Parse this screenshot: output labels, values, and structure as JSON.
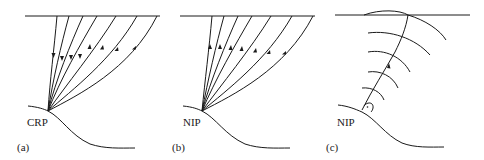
{
  "figure": {
    "panels": [
      {
        "id": "a",
        "caption": "(a)",
        "point_label": "CRP",
        "description": "Common reflection point: rays from reflector point to surface, 4 downgoing and 3 upgoing",
        "ray_count": 7,
        "arrow_directions": [
          "down",
          "down",
          "down",
          "down",
          "up",
          "up",
          "up"
        ]
      },
      {
        "id": "b",
        "caption": "(b)",
        "point_label": "NIP",
        "description": "Normal incidence point: all rays upgoing from NIP to surface",
        "ray_count": 7,
        "arrow_directions": [
          "up",
          "up",
          "up",
          "up",
          "up",
          "up",
          "up"
        ]
      },
      {
        "id": "c",
        "caption": "(c)",
        "point_label": "NIP",
        "description": "NIP wave: normal ray from NIP with expanding wavefronts, right-angle marker at reflector",
        "wavefront_count": 6
      }
    ],
    "colors": {
      "stroke": "#1a1a1a",
      "background": "#ffffff"
    }
  }
}
